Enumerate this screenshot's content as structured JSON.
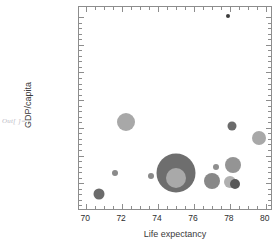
{
  "prompt": {
    "out_label": "Out[ ]="
  },
  "chart_data": {
    "type": "scatter",
    "title": "",
    "xlabel": "Life expectancy",
    "ylabel": "GDP/capita",
    "xlim": [
      69.6,
      80.4
    ],
    "ylim": [
      0,
      36800
    ],
    "grid": false,
    "legend": null,
    "xticks": [
      70,
      72,
      74,
      76,
      78,
      80
    ],
    "xtick_labels": [
      "70",
      "72",
      "74",
      "76",
      "78",
      "80"
    ],
    "yticks": [
      0,
      5000,
      10000,
      15000,
      20000,
      25000,
      30000,
      35000
    ],
    "ytick_labels": [
      "0",
      "5000",
      "10 000",
      "15 000",
      "20 000",
      "25 000",
      "30 000",
      "35 000"
    ],
    "x": [
      70.7,
      71.6,
      72.2,
      73.6,
      75.0,
      75.0,
      77.0,
      77.2,
      77.9,
      78.0,
      78.1,
      78.2,
      78.3,
      79.6
    ],
    "y": [
      3100,
      6900,
      16000,
      6400,
      6800,
      6000,
      5400,
      8000,
      35200,
      5200,
      15300,
      8300,
      4800,
      13200
    ],
    "sizes": [
      11,
      6,
      18,
      6,
      39,
      20,
      16,
      6,
      4,
      12,
      9,
      16,
      10,
      14
    ],
    "colors": [
      "#6b6b6b",
      "#8a8a8a",
      "#a8a8a8",
      "#8a8a8a",
      "#6e6e6e",
      "#a9a9a9",
      "#888888",
      "#8f8f8f",
      "#3c3c3c",
      "#b0b0b0",
      "#6b6b6b",
      "#949494",
      "#585858",
      "#a8a8a8"
    ],
    "points": [
      {
        "label": "",
        "x": 70.7,
        "y": 3100,
        "size": 11,
        "color": "#6b6b6b"
      },
      {
        "label": "",
        "x": 71.6,
        "y": 6900,
        "size": 6,
        "color": "#8a8a8a"
      },
      {
        "label": "",
        "x": 72.2,
        "y": 16000,
        "size": 18,
        "color": "#a8a8a8"
      },
      {
        "label": "",
        "x": 73.6,
        "y": 6400,
        "size": 6,
        "color": "#8a8a8a"
      },
      {
        "label": "",
        "x": 75.0,
        "y": 6800,
        "size": 39,
        "color": "#6e6e6e"
      },
      {
        "label": "",
        "x": 75.0,
        "y": 6000,
        "size": 20,
        "color": "#a9a9a9"
      },
      {
        "label": "",
        "x": 77.0,
        "y": 5400,
        "size": 16,
        "color": "#888888"
      },
      {
        "label": "",
        "x": 77.2,
        "y": 8000,
        "size": 6,
        "color": "#8f8f8f"
      },
      {
        "label": "",
        "x": 77.9,
        "y": 35200,
        "size": 4,
        "color": "#3c3c3c"
      },
      {
        "label": "",
        "x": 78.0,
        "y": 5200,
        "size": 12,
        "color": "#b0b0b0"
      },
      {
        "label": "",
        "x": 78.1,
        "y": 15300,
        "size": 9,
        "color": "#6b6b6b"
      },
      {
        "label": "",
        "x": 78.2,
        "y": 8300,
        "size": 16,
        "color": "#949494"
      },
      {
        "label": "",
        "x": 78.3,
        "y": 4800,
        "size": 10,
        "color": "#585858"
      },
      {
        "label": "",
        "x": 79.6,
        "y": 13200,
        "size": 14,
        "color": "#a8a8a8"
      }
    ],
    "frame_color": "#8d8d8d"
  }
}
